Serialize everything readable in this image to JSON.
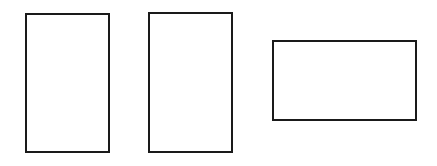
{
  "diagram": {
    "shapes": [
      {
        "id": "rect-1",
        "type": "rectangle",
        "orientation": "portrait",
        "x": 25,
        "y": 13,
        "width": 85,
        "height": 140,
        "stroke": "#1a1a1a",
        "fill": "#ffffff"
      },
      {
        "id": "rect-2",
        "type": "rectangle",
        "orientation": "portrait",
        "x": 148,
        "y": 12,
        "width": 85,
        "height": 141,
        "stroke": "#1a1a1a",
        "fill": "#ffffff"
      },
      {
        "id": "rect-3",
        "type": "rectangle",
        "orientation": "landscape",
        "x": 272,
        "y": 40,
        "width": 145,
        "height": 81,
        "stroke": "#1a1a1a",
        "fill": "#ffffff"
      }
    ],
    "background": "#ffffff"
  }
}
